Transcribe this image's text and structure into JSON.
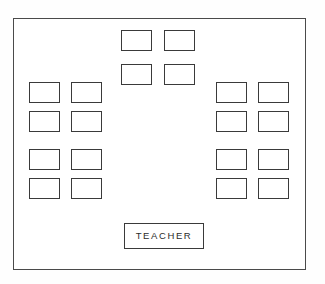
{
  "diagram": {
    "room": {
      "x": 13,
      "y": 18,
      "width": 293,
      "height": 252
    },
    "desk_size": {
      "width": 31,
      "height": 21
    },
    "teacher": {
      "label": "TEACHER",
      "x": 123,
      "y": 222,
      "width": 80,
      "height": 26
    },
    "groups": [
      {
        "name": "front-center-desks",
        "count": 4,
        "desks": [
          {
            "id": "desk-front-1",
            "x": 120,
            "y": 29
          },
          {
            "id": "desk-front-2",
            "x": 163,
            "y": 29
          },
          {
            "id": "desk-front-3",
            "x": 120,
            "y": 63
          },
          {
            "id": "desk-front-4",
            "x": 163,
            "y": 63
          }
        ]
      },
      {
        "name": "left-block-desks",
        "count": 8,
        "desks": [
          {
            "id": "desk-left-1",
            "x": 28,
            "y": 81
          },
          {
            "id": "desk-left-2",
            "x": 70,
            "y": 81
          },
          {
            "id": "desk-left-3",
            "x": 28,
            "y": 110
          },
          {
            "id": "desk-left-4",
            "x": 70,
            "y": 110
          },
          {
            "id": "desk-left-5",
            "x": 28,
            "y": 148
          },
          {
            "id": "desk-left-6",
            "x": 70,
            "y": 148
          },
          {
            "id": "desk-left-7",
            "x": 28,
            "y": 177
          },
          {
            "id": "desk-left-8",
            "x": 70,
            "y": 177
          }
        ]
      },
      {
        "name": "right-block-desks",
        "count": 8,
        "desks": [
          {
            "id": "desk-right-1",
            "x": 215,
            "y": 81
          },
          {
            "id": "desk-right-2",
            "x": 257,
            "y": 81
          },
          {
            "id": "desk-right-3",
            "x": 215,
            "y": 110
          },
          {
            "id": "desk-right-4",
            "x": 257,
            "y": 110
          },
          {
            "id": "desk-right-5",
            "x": 215,
            "y": 148
          },
          {
            "id": "desk-right-6",
            "x": 257,
            "y": 148
          },
          {
            "id": "desk-right-7",
            "x": 215,
            "y": 177
          },
          {
            "id": "desk-right-8",
            "x": 257,
            "y": 177
          }
        ]
      }
    ],
    "colors": {
      "room_border": "#4a4a4a",
      "desk_border": "#3a3a3a",
      "desk_fill": "#ffffff",
      "label_text": "#2b2b2b",
      "page_background": "#fefefe"
    }
  }
}
